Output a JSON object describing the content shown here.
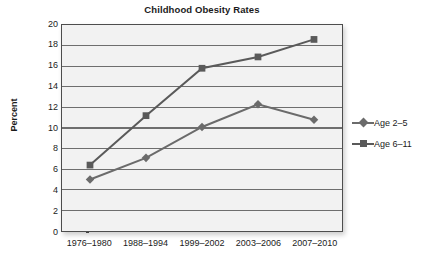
{
  "chart_data": {
    "type": "line",
    "title": "Childhood Obesity Rates",
    "xlabel": "",
    "ylabel": "Percent",
    "categories": [
      "1976–1980",
      "1988–1994",
      "1999–2002",
      "2003–2006",
      "2007–2010"
    ],
    "series": [
      {
        "name": "Age 2–5",
        "marker": "diamond",
        "color": "#6b6b6b",
        "values": [
          5.0,
          7.1,
          10.1,
          12.3,
          10.8
        ]
      },
      {
        "name": "Age 6–11",
        "marker": "square",
        "color": "#5a5a5a",
        "values": [
          6.4,
          11.2,
          15.8,
          16.9,
          18.6
        ]
      }
    ],
    "ylim": [
      0,
      20
    ],
    "ytick_values": [
      0,
      2,
      4,
      6,
      8,
      10,
      12,
      14,
      16,
      18,
      20
    ],
    "ytick_labels": [
      "0",
      "2",
      "4",
      "6",
      "8",
      "10",
      "12",
      "14",
      "16",
      "18",
      "20"
    ],
    "grid": true,
    "grid_axis": "y",
    "legend_position": "right",
    "plot_background": "#f2f2f2",
    "grid_color": "#6e6e6e",
    "axis_color": "#4d4d4d"
  }
}
